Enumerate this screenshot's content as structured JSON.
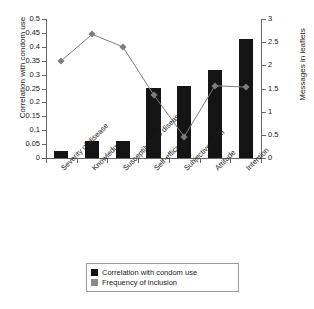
{
  "chart_data": {
    "type": "bar",
    "title": "",
    "categories": [
      "Severity of disease",
      "Knowledge",
      "Susceptibility to disease",
      "Self-efficacy",
      "Subjective norm",
      "Attitude",
      "Intention"
    ],
    "series": [
      {
        "name": "Correlation with condom use",
        "type": "bar",
        "axis": "left",
        "color": "#141414",
        "values": [
          0.025,
          0.063,
          0.063,
          0.252,
          0.259,
          0.318,
          0.428
        ]
      },
      {
        "name": "Frequency of inclusion",
        "type": "line",
        "axis": "right",
        "color": "#7d7d7d",
        "values": [
          2.1,
          2.67,
          2.4,
          1.37,
          0.46,
          1.56,
          1.53
        ]
      }
    ],
    "xlabel": "",
    "ylabel": "Correlation with condom use",
    "y2label": "Messages in leaflets",
    "ylim": [
      0,
      0.5
    ],
    "y2lim": [
      0,
      3
    ],
    "yticks": [
      "0",
      "0.05",
      "0.1",
      "0.15",
      "0.2",
      "0.25",
      "0.3",
      "0.35",
      "0.4",
      "0.45",
      "0.5"
    ],
    "y2ticks": [
      "0",
      "0.5",
      "1",
      "1.5",
      "2",
      "2.5",
      "3"
    ],
    "grid": false,
    "legend_position": "bottom"
  },
  "legend": {
    "items": [
      {
        "label": "Correlation with condom use",
        "swatch": "bar-swatch"
      },
      {
        "label": "Frequency of inclusion",
        "swatch": "marker-swatch"
      }
    ]
  }
}
